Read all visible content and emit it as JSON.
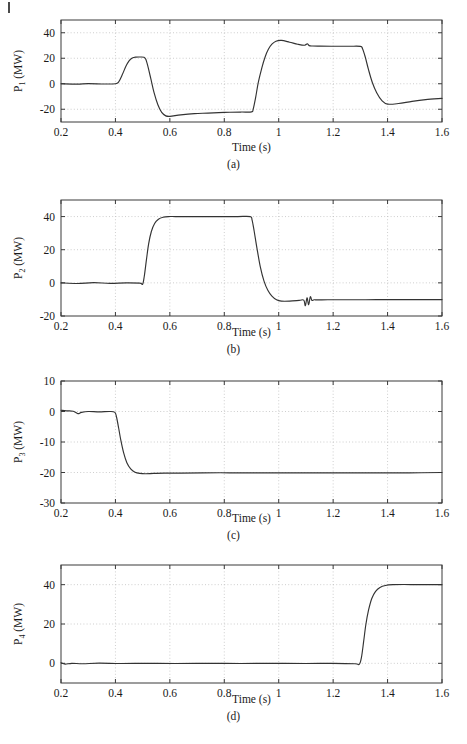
{
  "page": {
    "background": "#ffffff",
    "edge_mark": "page-edge-rule",
    "trace_color": "#333333",
    "grid_color": "#b9b9b9",
    "frame_color": "#3a3a3a"
  },
  "axis": {
    "xlabel": "Time (s)",
    "xticks": [
      "0.2",
      "0.4",
      "0.6",
      "0.8",
      "1",
      "1.2",
      "1.4",
      "1.6"
    ],
    "xtick_values": [
      0.2,
      0.4,
      0.6,
      0.8,
      1.0,
      1.2,
      1.4,
      1.6
    ],
    "xlim": [
      0.2,
      1.6
    ]
  },
  "captions": {
    "a": "(a)",
    "b": "(b)",
    "c": "(c)",
    "d": "(d)"
  },
  "ylabels": {
    "a": {
      "base": "P",
      "sub": "1",
      "unit": " (MW)"
    },
    "b": {
      "base": "P",
      "sub": "2",
      "unit": " (MW)"
    },
    "c": {
      "base": "P",
      "sub": "3",
      "unit": " (MW)"
    },
    "d": {
      "base": "P",
      "sub": "4",
      "unit": " (MW)"
    }
  },
  "chart_data": [
    {
      "id": "a",
      "type": "line",
      "title": "(a)",
      "xlabel": "Time (s)",
      "ylabel": "P1 (MW)",
      "xlim": [
        0.2,
        1.6
      ],
      "ylim": [
        -30,
        50
      ],
      "xticks": [
        0.2,
        0.4,
        0.6,
        0.8,
        1.0,
        1.2,
        1.4,
        1.6
      ],
      "xticklabels": [
        "0.2",
        "0.4",
        "0.6",
        "0.8",
        "1",
        "1.2",
        "1.4",
        "1.6"
      ],
      "yticks": [
        -20,
        0,
        20,
        40
      ],
      "yticklabels": [
        "-20",
        "0",
        "20",
        "40"
      ],
      "grid": true,
      "legend": null,
      "series": [
        {
          "name": "P1",
          "x": [
            0.2,
            0.26,
            0.3,
            0.36,
            0.4,
            0.412,
            0.425,
            0.438,
            0.45,
            0.462,
            0.475,
            0.49,
            0.505,
            0.512,
            0.52,
            0.53,
            0.542,
            0.556,
            0.57,
            0.585,
            0.6,
            0.64,
            0.69,
            0.74,
            0.8,
            0.86,
            0.9,
            0.906,
            0.915,
            0.925,
            0.938,
            0.95,
            0.962,
            0.975,
            0.99,
            1.01,
            1.04,
            1.07,
            1.095,
            1.105,
            1.112,
            1.125,
            1.15,
            1.2,
            1.26,
            1.3,
            1.308,
            1.318,
            1.33,
            1.344,
            1.36,
            1.38,
            1.4,
            1.44,
            1.49,
            1.54,
            1.6
          ],
          "y": [
            0.0,
            -0.3,
            0.1,
            -0.2,
            0.0,
            1.5,
            7.0,
            13.5,
            18.0,
            20.2,
            20.9,
            21.0,
            20.8,
            19.0,
            13.0,
            4.0,
            -7.0,
            -16.5,
            -22.5,
            -25.2,
            -25.6,
            -24.4,
            -23.4,
            -23.0,
            -22.5,
            -22.2,
            -22.1,
            -20.0,
            -11.0,
            1.0,
            12.5,
            21.0,
            27.0,
            31.0,
            33.4,
            34.0,
            32.6,
            31.0,
            30.2,
            31.4,
            29.9,
            29.6,
            29.5,
            29.4,
            29.4,
            29.3,
            27.5,
            21.0,
            11.0,
            1.0,
            -7.0,
            -13.5,
            -16.0,
            -15.5,
            -13.8,
            -12.5,
            -11.5
          ]
        }
      ]
    },
    {
      "id": "b",
      "type": "line",
      "title": "(b)",
      "xlabel": "Time (s)",
      "ylabel": "P2 (MW)",
      "xlim": [
        0.2,
        1.6
      ],
      "ylim": [
        -20,
        50
      ],
      "xticks": [
        0.2,
        0.4,
        0.6,
        0.8,
        1.0,
        1.2,
        1.4,
        1.6
      ],
      "xticklabels": [
        "0.2",
        "0.4",
        "0.6",
        "0.8",
        "1",
        "1.2",
        "1.4",
        "1.6"
      ],
      "yticks": [
        -20,
        0,
        20,
        40
      ],
      "yticklabels": [
        "-20",
        "0",
        "20",
        "40"
      ],
      "grid": true,
      "legend": null,
      "series": [
        {
          "name": "P2",
          "x": [
            0.2,
            0.26,
            0.32,
            0.38,
            0.44,
            0.49,
            0.5,
            0.506,
            0.514,
            0.522,
            0.532,
            0.544,
            0.558,
            0.575,
            0.595,
            0.62,
            0.66,
            0.72,
            0.79,
            0.85,
            0.895,
            0.902,
            0.91,
            0.92,
            0.932,
            0.946,
            0.96,
            0.975,
            0.992,
            1.01,
            1.04,
            1.075,
            1.092,
            1.098,
            1.104,
            1.11,
            1.116,
            1.122,
            1.13,
            1.145,
            1.18,
            1.24,
            1.32,
            1.4,
            1.48,
            1.56,
            1.6
          ],
          "y": [
            0.0,
            -0.4,
            0.1,
            -0.3,
            0.0,
            -0.2,
            -0.8,
            4.0,
            14.0,
            23.5,
            31.0,
            35.8,
            38.4,
            39.6,
            40.0,
            40.0,
            40.0,
            40.0,
            40.0,
            40.0,
            40.0,
            38.0,
            31.0,
            21.0,
            10.0,
            1.0,
            -4.5,
            -8.0,
            -10.2,
            -11.0,
            -11.0,
            -10.6,
            -10.4,
            -13.8,
            -9.0,
            -13.2,
            -8.4,
            -10.6,
            -10.2,
            -10.3,
            -10.2,
            -10.2,
            -10.2,
            -10.1,
            -10.1,
            -10.1,
            -10.1
          ]
        }
      ]
    },
    {
      "id": "c",
      "type": "line",
      "title": "(c)",
      "xlabel": "Time (s)",
      "ylabel": "P3 (MW)",
      "xlim": [
        0.2,
        1.6
      ],
      "ylim": [
        -30,
        10
      ],
      "xticks": [
        0.2,
        0.4,
        0.6,
        0.8,
        1.0,
        1.2,
        1.4,
        1.6
      ],
      "xticklabels": [
        "0.2",
        "0.4",
        "0.6",
        "0.8",
        "1",
        "1.2",
        "1.4",
        "1.6"
      ],
      "yticks": [
        -30,
        -20,
        -10,
        0,
        10
      ],
      "yticklabels": [
        "-30",
        "-20",
        "-10",
        "0",
        "10"
      ],
      "grid": true,
      "legend": null,
      "series": [
        {
          "name": "P3",
          "x": [
            0.2,
            0.22,
            0.245,
            0.262,
            0.275,
            0.3,
            0.34,
            0.38,
            0.398,
            0.404,
            0.412,
            0.42,
            0.43,
            0.442,
            0.456,
            0.472,
            0.49,
            0.51,
            0.54,
            0.58,
            0.64,
            0.72,
            0.82,
            0.92,
            1.02,
            1.12,
            1.24,
            1.36,
            1.48,
            1.6
          ],
          "y": [
            0.4,
            0.2,
            0.1,
            -0.7,
            -0.3,
            0.0,
            -0.1,
            0.0,
            -0.3,
            -1.8,
            -5.5,
            -9.5,
            -13.5,
            -16.8,
            -18.8,
            -19.9,
            -20.3,
            -20.4,
            -20.3,
            -20.2,
            -20.2,
            -20.1,
            -20.1,
            -20.1,
            -20.1,
            -20.1,
            -20.1,
            -20.1,
            -20.1,
            -20.0
          ]
        }
      ]
    },
    {
      "id": "d",
      "type": "line",
      "title": "(d)",
      "xlabel": "Time (s)",
      "ylabel": "P4 (MW)",
      "xlim": [
        0.2,
        1.6
      ],
      "ylim": [
        -10,
        50
      ],
      "xticks": [
        0.2,
        0.4,
        0.6,
        0.8,
        1.0,
        1.2,
        1.4,
        1.6
      ],
      "xticklabels": [
        "0.2",
        "0.4",
        "0.6",
        "0.8",
        "1",
        "1.2",
        "1.4",
        "1.6"
      ],
      "yticks": [
        0,
        20,
        40
      ],
      "yticklabels": [
        "0",
        "20",
        "40"
      ],
      "grid": true,
      "legend": null,
      "series": [
        {
          "name": "P4",
          "x": [
            0.2,
            0.215,
            0.24,
            0.28,
            0.34,
            0.42,
            0.52,
            0.62,
            0.74,
            0.86,
            0.98,
            1.1,
            1.2,
            1.28,
            1.296,
            1.304,
            1.312,
            1.32,
            1.33,
            1.342,
            1.356,
            1.372,
            1.392,
            1.42,
            1.46,
            1.51,
            1.56,
            1.6
          ],
          "y": [
            0.3,
            -0.4,
            0.0,
            -0.2,
            0.1,
            -0.1,
            0.0,
            -0.1,
            0.0,
            -0.1,
            0.0,
            -0.1,
            0.0,
            -0.2,
            -0.5,
            3.0,
            11.0,
            19.5,
            27.0,
            33.0,
            36.6,
            38.6,
            39.6,
            40.0,
            40.1,
            40.0,
            40.0,
            40.0
          ]
        }
      ]
    }
  ]
}
